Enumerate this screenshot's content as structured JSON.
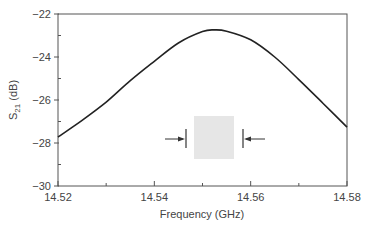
{
  "chart_data": {
    "type": "line",
    "title": "",
    "xlabel": "Frequency (GHz)",
    "ylabel": "S21 (dB)",
    "ylabel_main": "S",
    "ylabel_sub": "21",
    "ylabel_unit": " (dB)",
    "xlim": [
      14.52,
      14.58
    ],
    "ylim": [
      -30,
      -22
    ],
    "x_ticks": [
      14.52,
      14.54,
      14.56,
      14.58
    ],
    "x_tick_labels": [
      "14.52",
      "14.54",
      "14.56",
      "14.58"
    ],
    "x_minor_ticks": [
      14.53,
      14.55,
      14.57
    ],
    "y_ticks": [
      -22,
      -24,
      -26,
      -28,
      -30
    ],
    "y_tick_labels": [
      "−22",
      "−24",
      "−26",
      "−28",
      "−30"
    ],
    "y_minor_ticks": [
      -23,
      -25,
      -27,
      -29
    ],
    "grid": false,
    "legend": null,
    "series": [
      {
        "name": "S21",
        "color": "#222222",
        "x": [
          14.52,
          14.525,
          14.53,
          14.535,
          14.54,
          14.545,
          14.55,
          14.5525,
          14.555,
          14.56,
          14.565,
          14.57,
          14.575,
          14.58
        ],
        "y": [
          -27.72,
          -26.95,
          -26.1,
          -25.1,
          -24.2,
          -23.35,
          -22.82,
          -22.74,
          -22.8,
          -23.2,
          -24.0,
          -25.05,
          -26.15,
          -27.26
        ]
      }
    ],
    "annotations": [
      {
        "type": "inset-square",
        "description": "gray square marker with inward-pointing arrows on each side",
        "color": "#e6e6e6"
      }
    ]
  },
  "colors": {
    "axis": "#555555",
    "curve": "#222222",
    "inset": "#e6e6e6",
    "text": "#444444"
  }
}
